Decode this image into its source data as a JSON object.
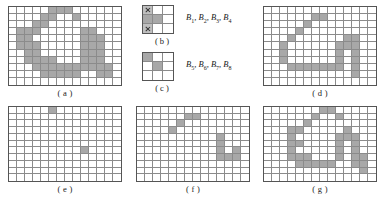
{
  "figure": {
    "grid_fill_color": "#a8a8a8",
    "grid_line_color": "#8b8b8b",
    "grid_border_color": "#555555",
    "background_color": "#ffffff"
  },
  "panels": [
    {
      "id": "a",
      "caption": "( a )",
      "cols": 14,
      "rows": 11,
      "filled": [
        [
          5,
          0
        ],
        [
          6,
          0
        ],
        [
          7,
          0
        ],
        [
          4,
          1
        ],
        [
          5,
          1
        ],
        [
          8,
          1
        ],
        [
          3,
          2
        ],
        [
          4,
          2
        ],
        [
          1,
          3
        ],
        [
          2,
          3
        ],
        [
          3,
          3
        ],
        [
          9,
          3
        ],
        [
          10,
          3
        ],
        [
          1,
          4
        ],
        [
          2,
          4
        ],
        [
          9,
          4
        ],
        [
          10,
          4
        ],
        [
          11,
          4
        ],
        [
          1,
          5
        ],
        [
          2,
          5
        ],
        [
          3,
          5
        ],
        [
          9,
          5
        ],
        [
          10,
          5
        ],
        [
          11,
          5
        ],
        [
          2,
          6
        ],
        [
          3,
          6
        ],
        [
          9,
          6
        ],
        [
          10,
          6
        ],
        [
          11,
          6
        ],
        [
          2,
          7
        ],
        [
          3,
          7
        ],
        [
          4,
          7
        ],
        [
          5,
          7
        ],
        [
          9,
          7
        ],
        [
          10,
          7
        ],
        [
          11,
          7
        ],
        [
          3,
          8
        ],
        [
          4,
          8
        ],
        [
          5,
          8
        ],
        [
          6,
          8
        ],
        [
          7,
          8
        ],
        [
          8,
          8
        ],
        [
          9,
          8
        ],
        [
          10,
          8
        ],
        [
          11,
          8
        ],
        [
          12,
          8
        ],
        [
          4,
          9
        ],
        [
          5,
          9
        ],
        [
          6,
          9
        ],
        [
          7,
          9
        ],
        [
          8,
          9
        ],
        [
          11,
          9
        ],
        [
          12,
          9
        ]
      ]
    },
    {
      "id": "d",
      "caption": "( d )",
      "cols": 14,
      "rows": 11,
      "filled": [
        [
          6,
          1
        ],
        [
          7,
          1
        ],
        [
          5,
          2
        ],
        [
          4,
          3
        ],
        [
          3,
          4
        ],
        [
          10,
          4
        ],
        [
          11,
          4
        ],
        [
          2,
          5
        ],
        [
          9,
          5
        ],
        [
          10,
          5
        ],
        [
          11,
          5
        ],
        [
          2,
          6
        ],
        [
          9,
          6
        ],
        [
          11,
          6
        ],
        [
          2,
          7
        ],
        [
          9,
          7
        ],
        [
          11,
          7
        ],
        [
          3,
          8
        ],
        [
          4,
          8
        ],
        [
          5,
          8
        ],
        [
          6,
          8
        ],
        [
          7,
          8
        ],
        [
          8,
          8
        ],
        [
          9,
          8
        ],
        [
          11,
          8
        ],
        [
          11,
          9
        ]
      ]
    },
    {
      "id": "e",
      "caption": "( e )",
      "cols": 14,
      "rows": 11,
      "filled": [
        [
          5,
          0
        ],
        [
          9,
          6
        ]
      ]
    },
    {
      "id": "f",
      "caption": "( f )",
      "cols": 14,
      "rows": 11,
      "filled": [
        [
          6,
          1
        ],
        [
          7,
          1
        ],
        [
          5,
          2
        ],
        [
          4,
          3
        ],
        [
          10,
          4
        ],
        [
          10,
          5
        ],
        [
          10,
          6
        ],
        [
          12,
          6
        ],
        [
          10,
          7
        ],
        [
          11,
          7
        ],
        [
          12,
          7
        ]
      ]
    },
    {
      "id": "g",
      "caption": "( g )",
      "cols": 14,
      "rows": 11,
      "filled": [
        [
          7,
          0
        ],
        [
          8,
          0
        ],
        [
          6,
          1
        ],
        [
          9,
          1
        ],
        [
          5,
          2
        ],
        [
          3,
          3
        ],
        [
          4,
          3
        ],
        [
          10,
          3
        ],
        [
          3,
          4
        ],
        [
          9,
          4
        ],
        [
          10,
          4
        ],
        [
          11,
          4
        ],
        [
          3,
          5
        ],
        [
          4,
          5
        ],
        [
          9,
          5
        ],
        [
          11,
          5
        ],
        [
          3,
          6
        ],
        [
          9,
          6
        ],
        [
          11,
          6
        ],
        [
          3,
          7
        ],
        [
          4,
          7
        ],
        [
          5,
          7
        ],
        [
          9,
          7
        ],
        [
          11,
          7
        ],
        [
          12,
          7
        ],
        [
          4,
          8
        ],
        [
          5,
          8
        ],
        [
          6,
          8
        ],
        [
          7,
          8
        ],
        [
          8,
          8
        ],
        [
          11,
          8
        ],
        [
          12,
          8
        ],
        [
          12,
          9
        ]
      ]
    }
  ],
  "structuring_elements": [
    {
      "id": "b",
      "caption": "( b )",
      "label": "B1, B2, B3, B4",
      "label_parts": [
        {
          "base": "B",
          "sub": "1",
          "sep": ", "
        },
        {
          "base": "B",
          "sub": "2",
          "sep": ", "
        },
        {
          "base": "B",
          "sub": "3",
          "sep": ", "
        },
        {
          "base": "B",
          "sub": "4",
          "sep": ""
        }
      ],
      "cols": 3,
      "rows": 3,
      "cells": [
        [
          "x",
          "empty",
          "empty"
        ],
        [
          "on",
          "on",
          "empty"
        ],
        [
          "x",
          "empty",
          "empty"
        ]
      ]
    },
    {
      "id": "c",
      "caption": "( c )",
      "label": "B5, B6, B7, B8",
      "label_parts": [
        {
          "base": "B",
          "sub": "5",
          "sep": ", "
        },
        {
          "base": "B",
          "sub": "6",
          "sep": ", "
        },
        {
          "base": "B",
          "sub": "7",
          "sep": ", "
        },
        {
          "base": "B",
          "sub": "8",
          "sep": ""
        }
      ],
      "cols": 3,
      "rows": 3,
      "cells": [
        [
          "on",
          "empty",
          "empty"
        ],
        [
          "empty",
          "on",
          "empty"
        ],
        [
          "empty",
          "empty",
          "empty"
        ]
      ]
    }
  ]
}
